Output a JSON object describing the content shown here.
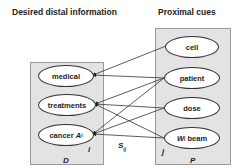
{
  "headers": {
    "left": "Desired distal information",
    "right": "Proximal cues"
  },
  "plates": {
    "distal": {
      "label": "D",
      "index": "i"
    },
    "proximal": {
      "label": "P",
      "index": "j"
    }
  },
  "distal_nodes": [
    {
      "id": "medical",
      "label": "medical"
    },
    {
      "id": "treatments",
      "label": "treatments"
    },
    {
      "id": "cancer",
      "label": "cancer",
      "var": "A",
      "var_sub": "i"
    }
  ],
  "proximal_nodes": [
    {
      "id": "cell",
      "label": "cell"
    },
    {
      "id": "patient",
      "label": "patient"
    },
    {
      "id": "dose",
      "label": "dose"
    },
    {
      "id": "beam",
      "label": "beam",
      "var": "W",
      "var_sub": "j"
    }
  ],
  "edge_label": {
    "text": "S",
    "sub": "ij"
  },
  "edges": [
    [
      "cell",
      "medical"
    ],
    [
      "patient",
      "medical"
    ],
    [
      "patient",
      "treatments"
    ],
    [
      "patient",
      "cancer"
    ],
    [
      "dose",
      "treatments"
    ],
    [
      "dose",
      "cancer"
    ],
    [
      "beam",
      "treatments"
    ],
    [
      "beam",
      "cancer"
    ]
  ]
}
